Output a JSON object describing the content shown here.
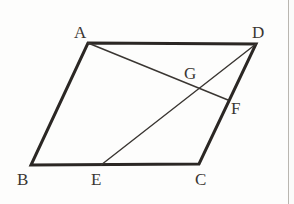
{
  "figure": {
    "type": "geometry-diagram",
    "shape": "parallelogram",
    "background_color": "#fdfdfc",
    "stroke_color_outline": "#2b2724",
    "stroke_color_inner": "#3a3632",
    "outline_width": 3,
    "inner_width": 1.4,
    "label_color": "#3a3632",
    "points": [
      {
        "id": "A",
        "label": "A",
        "x": 88,
        "y": 43,
        "label_x": 74,
        "label_y": 24
      },
      {
        "id": "D",
        "label": "D",
        "x": 256,
        "y": 44,
        "label_x": 252,
        "label_y": 24
      },
      {
        "id": "B",
        "label": "B",
        "x": 31,
        "y": 165,
        "label_x": 17,
        "label_y": 171
      },
      {
        "id": "C",
        "label": "C",
        "x": 199,
        "y": 164,
        "label_x": 195,
        "label_y": 171
      },
      {
        "id": "E",
        "label": "E",
        "x": 101,
        "y": 165,
        "label_x": 91,
        "label_y": 171
      },
      {
        "id": "F",
        "label": "F",
        "x": 228,
        "y": 100,
        "label_x": 231,
        "label_y": 100
      },
      {
        "id": "G",
        "label": "G",
        "x": 192,
        "y": 90,
        "label_x": 184,
        "label_y": 65
      }
    ],
    "outline_path": "M 88 43 L 256 44 L 199 164 L 31 165 Z",
    "segments": [
      {
        "name": "AD",
        "from": "A",
        "to": "D",
        "kind": "outline"
      },
      {
        "name": "DC",
        "from": "D",
        "to": "C",
        "kind": "outline"
      },
      {
        "name": "CB",
        "from": "C",
        "to": "B",
        "kind": "outline"
      },
      {
        "name": "BA",
        "from": "B",
        "to": "A",
        "kind": "outline"
      },
      {
        "name": "AF",
        "from": "A",
        "to": "F",
        "kind": "inner"
      },
      {
        "name": "DE",
        "from": "D",
        "to": "E",
        "kind": "inner"
      }
    ]
  },
  "page": {
    "right_rule_color": "#b9b6b0"
  }
}
